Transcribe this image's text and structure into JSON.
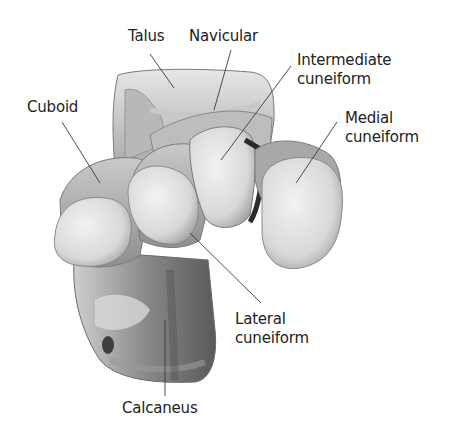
{
  "figure": {
    "background_color": "#ffffff",
    "label_color": "#222222",
    "leader_color": "#3a3a3a"
  },
  "labels": [
    {
      "id": "talus",
      "lines": [
        "Talus"
      ]
    },
    {
      "id": "navicular",
      "lines": [
        "Navicular"
      ]
    },
    {
      "id": "intermediate-cuneiform",
      "lines": [
        "Intermediate",
        "cuneiform"
      ]
    },
    {
      "id": "medial-cuneiform",
      "lines": [
        "Medial",
        "cuneiform"
      ]
    },
    {
      "id": "cuboid",
      "lines": [
        "Cuboid"
      ]
    },
    {
      "id": "lateral-cuneiform",
      "lines": [
        "Lateral",
        "cuneiform"
      ]
    },
    {
      "id": "calcaneus",
      "lines": [
        "Calcaneus"
      ]
    }
  ]
}
